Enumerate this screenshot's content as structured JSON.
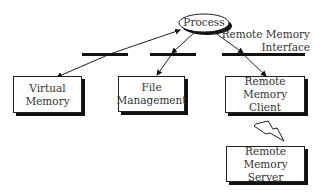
{
  "diagram": {
    "process": {
      "label": "Process"
    },
    "interface_label": {
      "line1": "Remote Memory",
      "line2": "Interface"
    },
    "modules": [
      {
        "line1": "Virtual",
        "line2": "Memory"
      },
      {
        "line1": "File",
        "line2": "Management"
      },
      {
        "line1": "Remote Memory",
        "line2": "Client"
      }
    ],
    "server": {
      "line1": "Remote Memory",
      "line2": "Server"
    },
    "connection": {
      "type": "lightning-bolt",
      "meaning": "network link"
    }
  }
}
